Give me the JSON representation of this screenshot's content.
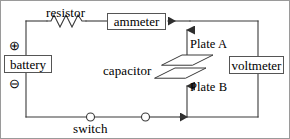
{
  "diagram": {
    "type": "electric-circuit-schematic",
    "components": {
      "resistor": {
        "label": "resistor",
        "symbol": "zigzag"
      },
      "ammeter": {
        "label": "ammeter",
        "symbol": "box"
      },
      "voltmeter": {
        "label": "voltmeter",
        "symbol": "box"
      },
      "battery": {
        "label": "battery",
        "symbol": "box",
        "positive_terminal": "⊕",
        "negative_terminal": "⊖"
      },
      "capacitor": {
        "label": "capacitor",
        "symbol": "parallel-plates-3d",
        "plate_top_label": "Plate A",
        "plate_bottom_label": "Plate B"
      },
      "switch": {
        "label": "switch",
        "symbol": "two-open-terminals"
      }
    },
    "annotations": {
      "current_arrow_top": "leftward current arrow on top wire",
      "current_arrow_bottom": "rightward current arrow on bottom wire",
      "arrow_to_plate_a": "upward arrow pointing to Plate A",
      "arrow_to_plate_b": "upward arrow pointing to Plate B"
    },
    "colors": {
      "wire": "#3a3a3a",
      "text": "#000000",
      "box_border": "#555555",
      "frame": "#9a9a9a",
      "background": "#ffffff"
    }
  }
}
